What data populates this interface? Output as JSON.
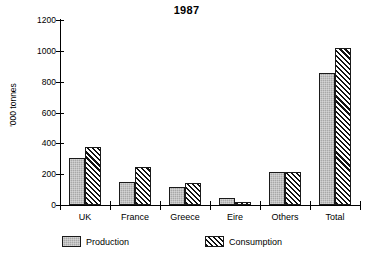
{
  "chart_data": {
    "type": "bar",
    "title": "1987",
    "xlabel": "",
    "ylabel": "'000 tonnes",
    "ylim": [
      0,
      1200
    ],
    "yticks": [
      0,
      200,
      400,
      600,
      800,
      1000,
      1200
    ],
    "ytick_labels": [
      "0",
      "200",
      "400",
      "600",
      "800",
      "1000",
      "1200"
    ],
    "grid": false,
    "legend_position": "bottom",
    "categories": [
      "UK",
      "France",
      "Greece",
      "Eire",
      "Others",
      "Total"
    ],
    "series": [
      {
        "name": "Production",
        "fill": "solid-grey",
        "color": "#a8a8a8",
        "values": [
          305,
          150,
          117,
          45,
          215,
          855
        ]
      },
      {
        "name": "Consumption",
        "fill": "diagonal-hatch",
        "color": "#111111",
        "values": [
          378,
          247,
          143,
          20,
          215,
          1020
        ]
      }
    ]
  },
  "axis": {
    "y_title": "'000 tonnes"
  },
  "legend": {
    "items": [
      {
        "label": "Production"
      },
      {
        "label": "Consumption"
      }
    ]
  }
}
